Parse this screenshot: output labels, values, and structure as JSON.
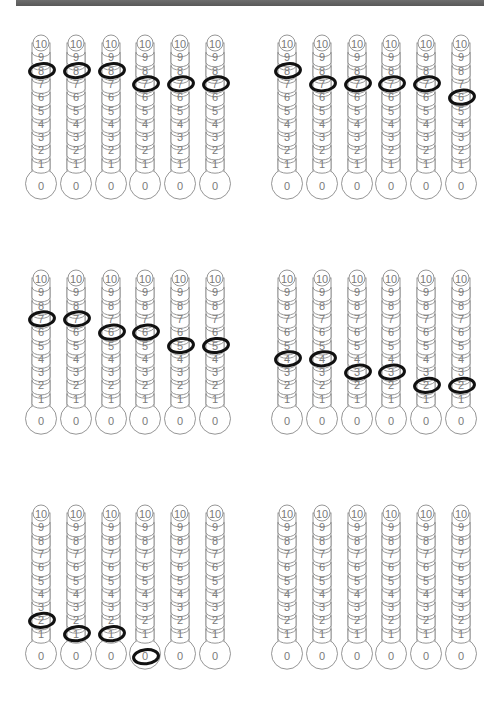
{
  "worksheet": {
    "scale_labels": [
      "0",
      "1",
      "2",
      "3",
      "4",
      "5",
      "6",
      "7",
      "8",
      "9",
      "10"
    ],
    "colors": {
      "outline": "#8a8a8a",
      "numerals": "#7a7a7a",
      "marker": "#111111",
      "top_bar": "#606060"
    },
    "panels": [
      {
        "name": "panel-top-left",
        "values": [
          8,
          8,
          8,
          7,
          7,
          7
        ]
      },
      {
        "name": "panel-top-right",
        "values": [
          8,
          7,
          7,
          7,
          7,
          6
        ]
      },
      {
        "name": "panel-middle-left",
        "values": [
          7,
          7,
          6,
          6,
          5,
          5
        ]
      },
      {
        "name": "panel-middle-right",
        "values": [
          4,
          4,
          3,
          3,
          2,
          2
        ]
      },
      {
        "name": "panel-bottom-left",
        "values": [
          2,
          1,
          1,
          0,
          null,
          null
        ]
      },
      {
        "name": "panel-bottom-right",
        "values": [
          null,
          null,
          null,
          null,
          null,
          null
        ]
      }
    ]
  }
}
